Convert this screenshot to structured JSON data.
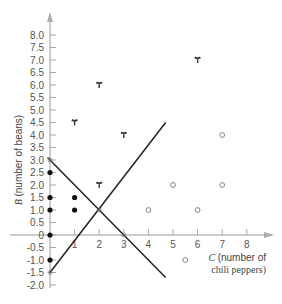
{
  "chart_data": {
    "type": "scatter",
    "title": "",
    "xlabel": "C (number of chili peppers)",
    "xlabel_lines": [
      "C (number of",
      "chili peppers)"
    ],
    "ylabel": "B (number of beans)",
    "xlim": [
      -1,
      9
    ],
    "ylim": [
      -2.0,
      8.5
    ],
    "x_ticks": [
      1,
      2,
      3,
      4,
      5,
      6,
      7,
      8
    ],
    "y_ticks": [
      8.0,
      7.5,
      7.0,
      6.5,
      6.0,
      5.5,
      5.0,
      4.5,
      4.0,
      3.5,
      3.0,
      2.5,
      2.0,
      1.5,
      1.0,
      0.5,
      0,
      -0.5,
      -1.0,
      -1.5,
      -2.0
    ],
    "y_tick_labels": [
      "8.0",
      "7.5",
      "7.0",
      "6.5",
      "6.0",
      "5.5",
      "5.0",
      "4.5",
      "4.0",
      "3.5",
      "3.0",
      "2.5",
      "2.0",
      "1.5",
      "1.0",
      "0.5",
      "0",
      "-0.5",
      "-1.0",
      "-1.5",
      "-2.0"
    ],
    "grid": false,
    "series": [
      {
        "name": "star markers",
        "marker": "tri-star",
        "points": [
          [
            1,
            4.5
          ],
          [
            2,
            6.0
          ],
          [
            3,
            4.0
          ],
          [
            6,
            7.0
          ],
          [
            2,
            2.0
          ]
        ]
      },
      {
        "name": "open circles",
        "marker": "open-circle",
        "points": [
          [
            7,
            4.0
          ],
          [
            5,
            2.0
          ],
          [
            7,
            2.0
          ],
          [
            4,
            1.0
          ],
          [
            6,
            1.0
          ],
          [
            5.5,
            -1.0
          ]
        ]
      },
      {
        "name": "filled dots",
        "marker": "filled-circle",
        "points": [
          [
            0,
            2.5
          ],
          [
            0,
            1.5
          ],
          [
            0,
            1.0
          ],
          [
            1,
            1.5
          ],
          [
            1,
            1.0
          ],
          [
            0,
            0
          ],
          [
            0,
            -1.0
          ]
        ]
      },
      {
        "name": "intercept markers",
        "marker": "small-star",
        "points": [
          [
            0,
            3.0
          ],
          [
            2,
            1.0
          ],
          [
            3,
            0
          ],
          [
            0,
            -1.5
          ]
        ]
      }
    ],
    "lines": [
      {
        "name": "line B = 3 - C",
        "from": [
          -0.1,
          3.1
        ],
        "to": [
          4.7,
          -1.7
        ]
      },
      {
        "name": "line B = 1.25C - 1.5",
        "from": [
          0,
          -1.5
        ],
        "to": [
          4.7,
          4.5
        ]
      }
    ]
  }
}
